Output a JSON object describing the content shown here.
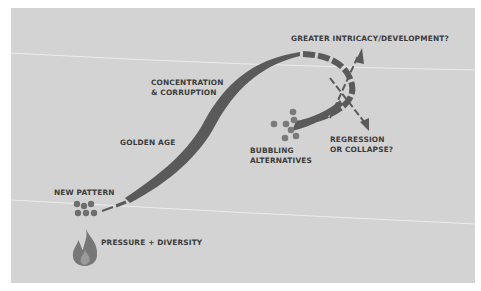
{
  "colors": {
    "background": "#d3d3d3",
    "curve": "#5a5a5a",
    "dots": "#6e6e6e",
    "flame": "#6f6f6f",
    "text": "#3c3c3c",
    "crease": "#ececec"
  },
  "labels": {
    "greater_intricacy": "GREATER INTRICACY/DEVELOPMENT?",
    "concentration": "CONCENTRATION\n& CORRUPTION",
    "golden_age": "GOLDEN AGE",
    "regression": "REGRESSION\nOR COLLAPSE?",
    "bubbling": "BUBBLING\nALTERNATIVES",
    "new_pattern": "NEW PATTERN",
    "pressure": "PRESSURE + DIVERSITY"
  },
  "icons": {
    "flame": "flame-icon",
    "new_pattern_cluster": "dot-cluster-icon",
    "bubbling_cluster": "dot-cluster-icon"
  }
}
